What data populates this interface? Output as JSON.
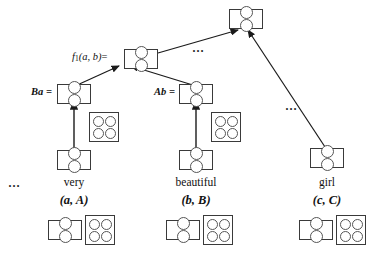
{
  "figure": {
    "background_color": "#ffffff",
    "stroke_color": "#3a3a3a",
    "circle_color": "#555555"
  },
  "labels": {
    "root_function": {
      "fn": "f",
      "subscript": "1",
      "args": "(a, b)",
      "equals": "="
    },
    "left_operand": "Ba =",
    "right_operand": "Ab =",
    "ellipsis": "…"
  },
  "ellipses": {
    "near_root_edge": "…",
    "near_girl_edge": "…",
    "left_of_very": "…"
  },
  "leaves": [
    {
      "word": "very",
      "pair": "(a, A)",
      "vector_label": "a",
      "matrix_label": "A"
    },
    {
      "word": "beautiful",
      "pair": "(b, B)",
      "vector_label": "b",
      "matrix_label": "B"
    },
    {
      "word": "girl",
      "pair": "(c, C)",
      "vector_label": "c",
      "matrix_label": "C"
    }
  ],
  "nodes": {
    "root": {
      "kind": "vector",
      "cells": 2
    },
    "f1_node": {
      "kind": "vector",
      "cells": 2
    },
    "ba_node": {
      "kind": "vector",
      "cells": 2
    },
    "ab_node": {
      "kind": "vector",
      "cells": 2
    },
    "very_vector": {
      "kind": "vector",
      "cells": 2
    },
    "very_matrix": {
      "kind": "matrix",
      "cells": 4
    },
    "beautiful_vector": {
      "kind": "vector",
      "cells": 2
    },
    "beautiful_matrix": {
      "kind": "matrix",
      "cells": 4
    },
    "girl_vector": {
      "kind": "vector",
      "cells": 2
    },
    "bottom_very_vector": {
      "kind": "vector",
      "cells": 2
    },
    "bottom_very_matrix": {
      "kind": "matrix",
      "cells": 4
    },
    "bottom_beautiful_vector": {
      "kind": "vector",
      "cells": 2
    },
    "bottom_beautiful_matrix": {
      "kind": "matrix",
      "cells": 4
    },
    "bottom_girl_vector": {
      "kind": "vector",
      "cells": 2
    },
    "bottom_girl_matrix": {
      "kind": "matrix",
      "cells": 4
    }
  }
}
